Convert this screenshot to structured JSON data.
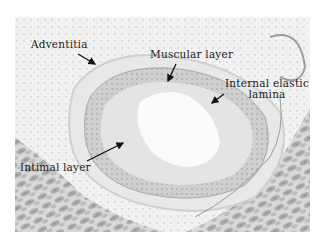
{
  "figure": {
    "type": "histology micrograph",
    "colors": {
      "background": "#ffffff",
      "tissue_light": "#e6e6e6",
      "tissue_mid": "#bdbdbd",
      "tissue_dark": "#8a8a8a",
      "label_text": "#1a1a1a"
    },
    "labels": [
      {
        "id": "adventitia",
        "text": "Adventitia"
      },
      {
        "id": "muscular_layer",
        "text": "Muscular layer"
      },
      {
        "id": "internal_elastic_lamina",
        "line1": "Internal elastic",
        "line2": "lamina"
      },
      {
        "id": "intimal_layer",
        "text": "Intimal layer"
      }
    ]
  }
}
